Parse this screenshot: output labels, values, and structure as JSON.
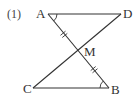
{
  "problem_label": "(1)",
  "points": {
    "A": "A",
    "B": "B",
    "C": "C",
    "D": "D",
    "M": "M"
  },
  "segments": [
    "AD",
    "CB",
    "AB",
    "CD"
  ],
  "equal_marks": {
    "segments": [
      "AM",
      "MB"
    ],
    "style": "double-tick"
  },
  "equal_angles": [
    "DAB",
    "CBA"
  ],
  "colors": {
    "ink": "#333333",
    "background": "#ffffff"
  }
}
